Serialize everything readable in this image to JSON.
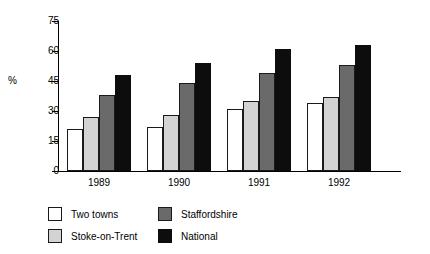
{
  "chart_data": {
    "type": "bar",
    "title": "",
    "xlabel": "",
    "ylabel": "%",
    "categories": [
      "1989",
      "1990",
      "1991",
      "1992"
    ],
    "series": [
      {
        "name": "Two towns",
        "color": "#ffffff",
        "values": [
          21,
          22,
          31,
          34
        ]
      },
      {
        "name": "Stoke-on-Trent",
        "color": "#d3d3d3",
        "values": [
          27,
          28,
          35,
          37
        ]
      },
      {
        "name": "Staffordshire",
        "color": "#6a6a6a",
        "values": [
          38,
          44,
          49,
          53
        ]
      },
      {
        "name": "National",
        "color": "#0d0d0d",
        "values": [
          48,
          54,
          61,
          63
        ]
      }
    ],
    "ylim": [
      0,
      75
    ],
    "yticks": [
      0,
      15,
      30,
      45,
      60,
      75
    ],
    "ytick_labels": [
      "0",
      "15",
      "30",
      "45",
      "60",
      "75"
    ],
    "grid": false,
    "legend_position": "bottom"
  },
  "legend": {
    "items": [
      {
        "label": "Two towns"
      },
      {
        "label": "Stoke-on-Trent"
      },
      {
        "label": "Staffordshire"
      },
      {
        "label": "National"
      }
    ]
  }
}
